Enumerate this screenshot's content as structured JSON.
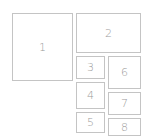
{
  "diagram": {
    "border_color": "#c4c4c4",
    "label_color": "#9a9a9a",
    "boxes": [
      {
        "label": "1",
        "x": 12,
        "y": 13,
        "w": 61,
        "h": 68
      },
      {
        "label": "2",
        "x": 76,
        "y": 13,
        "w": 65,
        "h": 40
      },
      {
        "label": "3",
        "x": 76,
        "y": 56,
        "w": 29,
        "h": 23
      },
      {
        "label": "4",
        "x": 76,
        "y": 82,
        "w": 29,
        "h": 27
      },
      {
        "label": "5",
        "x": 76,
        "y": 112,
        "w": 29,
        "h": 21
      },
      {
        "label": "6",
        "x": 108,
        "y": 56,
        "w": 33,
        "h": 33
      },
      {
        "label": "7",
        "x": 108,
        "y": 92,
        "w": 33,
        "h": 23
      },
      {
        "label": "8",
        "x": 108,
        "y": 118,
        "w": 33,
        "h": 18
      }
    ]
  }
}
